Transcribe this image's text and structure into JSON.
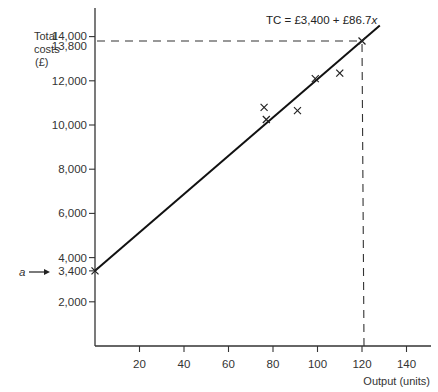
{
  "chart_data": {
    "type": "scatter",
    "title": "",
    "xlabel": "Output (units)",
    "ylabel_lines": [
      "Total",
      "costs",
      "(£)"
    ],
    "ylabel": "Total costs (£)",
    "x_ticks": [
      20,
      40,
      60,
      80,
      100,
      120,
      140
    ],
    "x_tick_labels": [
      "20",
      "40",
      "60",
      "80",
      "100",
      "120",
      "140"
    ],
    "y_ticks": [
      2000,
      3400,
      4000,
      6000,
      8000,
      10000,
      12000,
      13800,
      14000
    ],
    "y_tick_labels": [
      "2,000",
      "3,400",
      "4,000",
      "6,000",
      "8,000",
      "10,000",
      "12,000",
      "13,800",
      "14,000"
    ],
    "xlim": [
      0,
      150
    ],
    "ylim": [
      0,
      15000
    ],
    "grid": false,
    "series": [
      {
        "name": "Observed total costs",
        "marker": "x",
        "points": [
          {
            "x": 76,
            "y": 10800
          },
          {
            "x": 77,
            "y": 10250
          },
          {
            "x": 91,
            "y": 10650
          },
          {
            "x": 99,
            "y": 12100
          },
          {
            "x": 110,
            "y": 12350
          },
          {
            "x": 120,
            "y": 13800
          }
        ]
      },
      {
        "name": "Fitted line",
        "type": "line",
        "equation": "TC = £3,400 + £86.7x",
        "intercept": 3400,
        "slope": 86.7,
        "x_range": [
          0,
          128
        ]
      }
    ],
    "annotations": [
      {
        "text": "TC = £3,400 + £86.7x",
        "position": "top-right, at end of line"
      },
      {
        "text": "a",
        "arrow_to": {
          "x": 0,
          "y": 3400
        },
        "meaning": "intercept a = 3,400"
      },
      {
        "type": "dashed-guide",
        "from": {
          "x": 0,
          "y": 13800
        },
        "to": {
          "x": 120,
          "y": 13800
        }
      },
      {
        "type": "dashed-guide",
        "from": {
          "x": 120,
          "y": 0
        },
        "to": {
          "x": 120,
          "y": 13800
        }
      }
    ]
  },
  "labels": {
    "equation_prefix": "TC = £3,400 + £86.7",
    "equation_var": "x",
    "intercept_symbol": "a",
    "x_axis_title": "Output (units)",
    "y_axis_title_1": "Total",
    "y_axis_title_2": "costs",
    "y_axis_title_3": "(£)"
  }
}
